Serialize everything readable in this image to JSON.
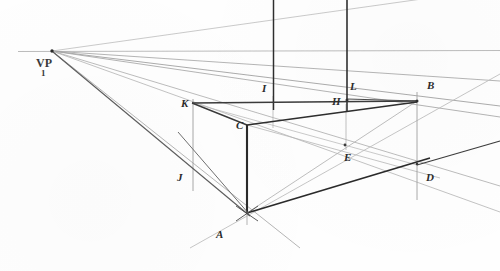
{
  "figure": {
    "medium": "pencil on paper",
    "background_color": "#fefefe",
    "ink_color": "#2b2b2b",
    "light_ink_color": "#9a9a9a",
    "width": 500,
    "height": 271
  },
  "vanishing_point": {
    "label": "VP",
    "subscript": "1",
    "x": 52,
    "y": 51
  },
  "horizon": {
    "name": "horizon-line",
    "y": 51,
    "x_start": 18,
    "x_end": 500,
    "color": "#b8b8b8"
  },
  "points": [
    {
      "id": "A",
      "label": "A",
      "x": 247,
      "y": 213,
      "label_x": 216,
      "label_y": 228
    },
    {
      "id": "B",
      "label": "B",
      "x": 417,
      "y": 101,
      "label_x": 427,
      "label_y": 79
    },
    {
      "id": "C",
      "label": "C",
      "x": 247,
      "y": 125,
      "label_x": 236,
      "label_y": 119
    },
    {
      "id": "D",
      "label": "D",
      "x": 417,
      "y": 165,
      "label_x": 426,
      "label_y": 171
    },
    {
      "id": "E",
      "label": "E",
      "x": 345,
      "y": 145,
      "label_x": 344,
      "label_y": 151
    },
    {
      "id": "H",
      "label": "H",
      "x": 347,
      "y": 104,
      "label_x": 332,
      "label_y": 95
    },
    {
      "id": "I",
      "label": "I",
      "x": 273,
      "y": 100,
      "label_x": 262,
      "label_y": 82
    },
    {
      "id": "J",
      "label": "J",
      "x": 193,
      "y": 172,
      "label_x": 177,
      "label_y": 171
    },
    {
      "id": "K",
      "label": "K",
      "x": 192,
      "y": 103,
      "label_x": 181,
      "label_y": 97
    },
    {
      "id": "L",
      "label": "L",
      "x": 347,
      "y": 99,
      "label_x": 350,
      "label_y": 80
    }
  ],
  "construction_lines": {
    "convergence_rays_from_vp": 7,
    "vertical_posts": 2,
    "box_edges": 12
  },
  "chart_data": {
    "type": "scatter",
    "xlabel": "",
    "ylabel": "",
    "categories": [
      "VP",
      "A",
      "B",
      "C",
      "D",
      "E",
      "H",
      "I",
      "J",
      "K",
      "L"
    ],
    "x": [
      52,
      247,
      417,
      247,
      417,
      345,
      347,
      273,
      193,
      192,
      347
    ],
    "y": [
      51,
      213,
      101,
      125,
      165,
      145,
      104,
      100,
      172,
      103,
      99
    ],
    "grid": false,
    "legend": "none"
  }
}
